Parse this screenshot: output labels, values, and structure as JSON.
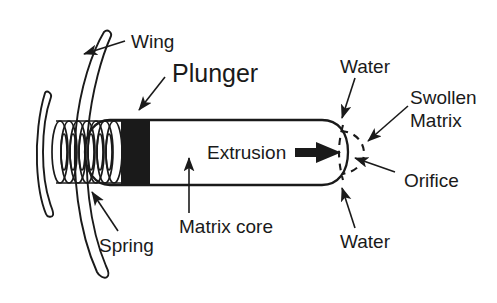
{
  "figure": {
    "background_color": "#ffffff",
    "ink_color": "#1a1a1a"
  },
  "labels": {
    "wing": "Wing",
    "plunger": "Plunger",
    "spring": "Spring",
    "matrix_core": "Matrix core",
    "extrusion": "Extrusion",
    "water_top": "Water",
    "water_bottom": "Water",
    "swollen_matrix_line1": "Swollen",
    "swollen_matrix_line2": "Matrix",
    "orifice": "Orifice"
  },
  "components": [
    {
      "name": "wing-outer",
      "label": "Wing",
      "description": "long curved outer wing arc on left side"
    },
    {
      "name": "wing-inner",
      "label": "Wing",
      "description": "short curved inner wing arc on left side"
    },
    {
      "name": "capsule-body",
      "description": "rounded rectangle capsule shell"
    },
    {
      "name": "spring",
      "label": "Spring",
      "description": "compressed helical coil at left end of capsule"
    },
    {
      "name": "plunger",
      "label": "Plunger",
      "description": "solid black block between spring and matrix core"
    },
    {
      "name": "matrix-core",
      "label": "Matrix core",
      "description": "empty interior region right of plunger"
    },
    {
      "name": "orifice",
      "label": "Orifice",
      "description": "opening at right tip of capsule"
    },
    {
      "name": "swollen-matrix",
      "label": "Swollen Matrix",
      "description": "dashed bulge emerging through the orifice"
    },
    {
      "name": "extrusion-arrow",
      "label": "Extrusion",
      "description": "thick arrow pointing right toward the orifice"
    },
    {
      "name": "water-inflow-top",
      "label": "Water",
      "description": "arrow entering capsule from above right"
    },
    {
      "name": "water-inflow-bottom",
      "label": "Water",
      "description": "arrow entering capsule from below right"
    }
  ]
}
